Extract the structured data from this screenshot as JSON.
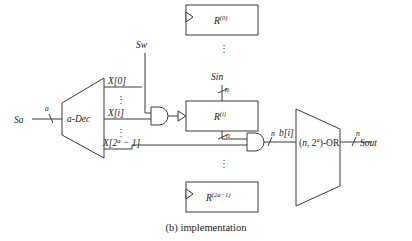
{
  "figure": {
    "caption_tag": "(b)",
    "caption_text": "implementation",
    "title": "(b) implementation"
  },
  "inputs": {
    "address": {
      "label": "Sa",
      "bus_width": "a"
    },
    "write_enable": {
      "label": "Sw"
    },
    "data_in": {
      "label": "Sin",
      "bus_width": "n"
    }
  },
  "outputs": {
    "data_out": {
      "label": "Sout",
      "bus_width": "n"
    }
  },
  "decoder": {
    "label": "a-Dec",
    "outputs": [
      {
        "label": "X[0]"
      },
      {
        "label": "X[i]"
      },
      {
        "label": "X[2",
        "sup": "a",
        "tail": " − 1]"
      }
    ],
    "output_labels_flat": [
      "X[0]",
      "X[i]",
      "X[2a − 1]"
    ],
    "ellipsis": "⋮"
  },
  "registers": [
    {
      "name": "R",
      "sup": "(0)",
      "clock_marker": "triangle"
    },
    {
      "name": "R",
      "sup": "(i)",
      "clock_marker": "triangle"
    },
    {
      "name": "R",
      "sup": "(2a−1)",
      "clock_marker": "triangle"
    }
  ],
  "register_vdots": "⋮",
  "gates": {
    "write_and": {
      "type": "AND",
      "label": ""
    },
    "read_and": {
      "type": "AND",
      "label": ""
    }
  },
  "or_block": {
    "label_open": "(",
    "label_n": "n",
    "label_comma": ", ",
    "label_two": "2",
    "label_sup": "a",
    "label_close": ")-OR",
    "label_flat": "(n, 2a)-OR"
  },
  "bus_labels": {
    "sin_width": "n",
    "reg_in_width": "n",
    "reg_out_width": "n",
    "and_out_width": "n",
    "sout_width": "n",
    "addr_width": "a"
  },
  "signals": {
    "bit_out": "b[i]"
  },
  "colors": {
    "stroke": "#3a3a3a",
    "text": "#1a1a1a",
    "background": "#ffffff"
  }
}
